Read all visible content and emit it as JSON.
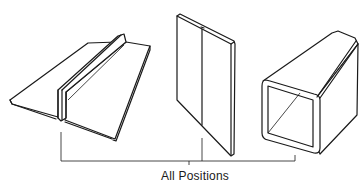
{
  "figure": {
    "caption": "All Positions",
    "items": [
      {
        "name": "flanged-edge-joint",
        "description": "Two bent sheets joined at upstanding flanges"
      },
      {
        "name": "butt-joint-plate",
        "description": "Vertical plate with butt seam"
      },
      {
        "name": "square-tube-seam",
        "description": "Square tube with longitudinal corner seam"
      }
    ],
    "colors": {
      "line": "#1a1a1a",
      "background": "#ffffff"
    }
  }
}
